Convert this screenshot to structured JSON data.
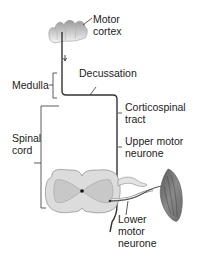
{
  "labels": {
    "motor_cortex": [
      "Motor",
      "cortex"
    ],
    "decussation": "Decussation",
    "medulla": "Medulla",
    "corticospinal_tract": [
      "Corticospinal",
      "tract"
    ],
    "spinal_cord": [
      "Spinal",
      "cord"
    ],
    "upper_motor_neurone": [
      "Upper motor",
      "neurone"
    ],
    "lower_motor_neurone": [
      "Lower",
      "motor",
      "neurone"
    ]
  },
  "colors": {
    "line": "#333333",
    "cord_fill": "#dcdcdc",
    "grey_matter": "#c8c8c8",
    "muscle": "#777777"
  }
}
